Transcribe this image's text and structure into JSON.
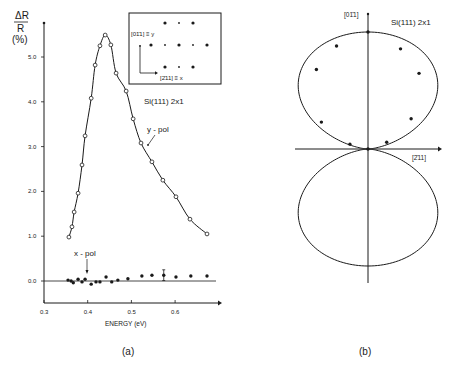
{
  "chart_data": [
    {
      "panel": "(a)",
      "type": "scatter",
      "xlabel": "ENERGY (eV)",
      "ylabel": "ΔR / R (%)",
      "ylabel_top": "ΔR",
      "ylabel_bottom": "R",
      "ylabel_unit": "(%)",
      "xlim": [
        0.3,
        0.69
      ],
      "ylim": [
        -0.5,
        5.8
      ],
      "xticks": [
        0.3,
        0.4,
        0.5,
        0.6
      ],
      "xtick_labels": [
        "0.3",
        "0.4",
        "0.5",
        "0.6"
      ],
      "yticks": [
        0.0,
        1.0,
        2.0,
        3.0,
        4.0,
        5.0
      ],
      "ytick_labels": [
        "0.0",
        "1.0",
        "2.0",
        "3.0",
        "4.0",
        "5.0"
      ],
      "grid": false,
      "annotation_sample": "Si(111) 2x1",
      "series": [
        {
          "name": "y-pol",
          "marker": "open-circle",
          "line": "smooth fit",
          "x": [
            0.357,
            0.364,
            0.369,
            0.378,
            0.387,
            0.394,
            0.408,
            0.417,
            0.428,
            0.44,
            0.453,
            0.465,
            0.488,
            0.504,
            0.522,
            0.547,
            0.572,
            0.602,
            0.634,
            0.673
          ],
          "y": [
            0.98,
            1.21,
            1.54,
            1.96,
            2.59,
            3.24,
            4.08,
            4.82,
            5.25,
            5.49,
            5.27,
            4.64,
            4.24,
            3.62,
            3.08,
            2.66,
            2.25,
            1.88,
            1.38,
            1.05
          ]
        },
        {
          "name": "x-pol",
          "marker": "filled-circle",
          "x": [
            0.355,
            0.362,
            0.367,
            0.378,
            0.387,
            0.394,
            0.408,
            0.419,
            0.428,
            0.442,
            0.455,
            0.469,
            0.492,
            0.524,
            0.547,
            0.574,
            0.602,
            0.636,
            0.673
          ],
          "y": [
            0.02,
            0.0,
            -0.04,
            0.04,
            -0.02,
            0.04,
            -0.07,
            -0.02,
            -0.02,
            0.09,
            -0.02,
            0.02,
            0.05,
            0.11,
            0.13,
            0.13,
            0.09,
            0.11,
            0.11
          ],
          "error_bar_at": 0.574,
          "error_bar_half": 0.12
        }
      ],
      "inset": {
        "label_y": "[01̄1] ≡ y",
        "label_x": "[2̄11] ≡ x",
        "pattern": "2x1 LEED spots"
      }
    },
    {
      "panel": "(b)",
      "type": "polar",
      "title": "Si(111) 2x1",
      "axis_vertical_label": "[01̄1]",
      "axis_horizontal_label": "[2̄11]",
      "description": "Polarization dependence of ΔR/R; two-lobe cos²-like pattern along [01̄1]",
      "measured_points_angle_deg_from_horizontal": [
        90,
        107,
        72,
        123,
        56,
        150,
        35,
        165,
        20,
        0
      ],
      "measured_points_relative_radius": [
        1.0,
        0.92,
        0.9,
        0.81,
        0.78,
        0.46,
        0.45,
        0.16,
        0.17,
        0.0
      ]
    }
  ],
  "panel_labels": {
    "a": "(a)",
    "b": "(b)"
  },
  "labels": {
    "ypol": "y - pol",
    "xpol": "x - pol",
    "sample_a": "Si(111) 2x1",
    "sample_b": "Si(111) 2x1",
    "inset_y": "[01̄1] ≡ y",
    "inset_x": "[2̄11] ≡ x",
    "polar_v": "[01̄1]",
    "polar_h": "[2̄11]",
    "xlabel": "ENERGY (eV)",
    "ylabel_top": "ΔR",
    "ylabel_bottom": "R",
    "ylabel_unit": "(%)"
  }
}
